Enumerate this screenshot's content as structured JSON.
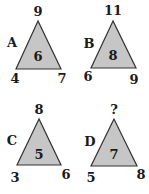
{
  "colors": {
    "triangle_fill": "#c6c6c6",
    "triangle_stroke": "#333333",
    "text": "#1a1a1a",
    "background": "#ffffff"
  },
  "triangles": [
    {
      "label": "A",
      "top": "9",
      "left": "4",
      "right": "7",
      "center": "6"
    },
    {
      "label": "B",
      "top": "11",
      "left": "6",
      "right": "9",
      "center": "8"
    },
    {
      "label": "C",
      "top": "8",
      "left": "3",
      "right": "6",
      "center": "5"
    },
    {
      "label": "D",
      "top": "?",
      "left": "5",
      "right": "8",
      "center": "7"
    }
  ]
}
